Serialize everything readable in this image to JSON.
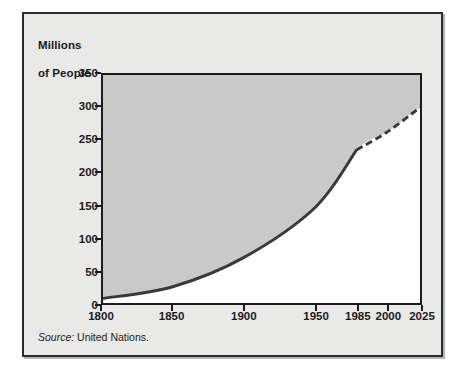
{
  "figure": {
    "axis_title_line1": "Millions",
    "axis_title_line2": "of People",
    "source_label": "Source:",
    "source_value": "United Nations.",
    "panel_bg": "#e9e9e7",
    "plot_bg": "#ffffff",
    "area_fill": "#c9c9c9",
    "line_color": "#3a3a3a",
    "frame_color": "#1c1c1c"
  },
  "chart_data": {
    "type": "area",
    "title": "",
    "subtitle": "",
    "xlabel": "",
    "ylabel": "Millions of People",
    "x_tick_labels": [
      "1800",
      "1850",
      "1900",
      "1950",
      "1985",
      "2000",
      "2025"
    ],
    "x_tick_values": [
      1800,
      1850,
      1900,
      1950,
      1985,
      2000,
      2025
    ],
    "x_tick_positions_pct": [
      0,
      22.0,
      44.5,
      67.0,
      80.0,
      89.5,
      100.0
    ],
    "y_tick_labels": [
      "0",
      "50",
      "100",
      "150",
      "200",
      "250",
      "300",
      "350"
    ],
    "y_tick_values": [
      0,
      50,
      100,
      150,
      200,
      250,
      300,
      350
    ],
    "ylim": [
      0,
      350
    ],
    "grid": false,
    "legend": "none",
    "series": [
      {
        "name": "Population",
        "style": "solid",
        "note": "historical",
        "x": [
          1800,
          1850,
          1900,
          1950,
          1985
        ],
        "values": [
          7,
          25,
          70,
          147,
          235
        ]
      },
      {
        "name": "Population (projected)",
        "style": "dashed",
        "note": "projection",
        "x": [
          1985,
          2000,
          2025
        ],
        "values": [
          235,
          262,
          300
        ]
      }
    ],
    "fill_region": "above-curve",
    "annotations": []
  }
}
